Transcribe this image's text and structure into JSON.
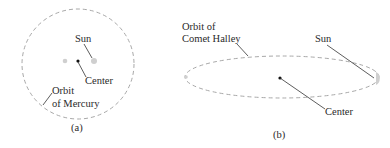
{
  "panels": [
    {
      "id": "a",
      "caption": "(a)",
      "orbit_label_line1": "Orbit",
      "orbit_label_line2": "of Mercury",
      "sun_label": "Sun",
      "center_label": "Center",
      "orbit_shape": "nearly circular ellipse"
    },
    {
      "id": "b",
      "caption": "(b)",
      "orbit_label_line1": "Orbit of",
      "orbit_label_line2": "Comet Halley",
      "sun_label": "Sun",
      "center_label": "Center",
      "orbit_shape": "highly eccentric ellipse"
    }
  ],
  "colors": {
    "orbit_dash": "#a8a8a8",
    "focus_dot": "#c8c8c8",
    "center_dot": "#111111",
    "leader_line": "#333333",
    "text": "#2a2a2a"
  }
}
